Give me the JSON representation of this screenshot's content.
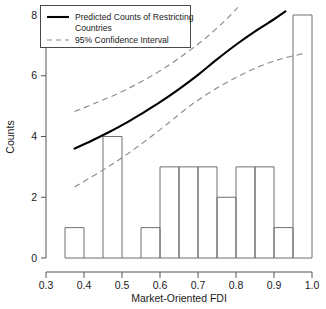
{
  "chart_data": {
    "type": "bar",
    "title": "",
    "xlabel": "Market-Oriented FDI",
    "ylabel": "Counts",
    "xlim": [
      0.3,
      1.0
    ],
    "ylim": [
      0,
      8
    ],
    "grid": false,
    "legend_position": "top-left",
    "x_ticks": [
      "0.3",
      "0.4",
      "0.5",
      "0.6",
      "0.7",
      "0.8",
      "0.9",
      "1.0"
    ],
    "x_tick_values": [
      0.3,
      0.4,
      0.5,
      0.6,
      0.7,
      0.8,
      0.9,
      1.0
    ],
    "y_ticks": [
      "0",
      "2",
      "4",
      "6",
      "8"
    ],
    "y_tick_values": [
      0,
      2,
      4,
      6,
      8
    ],
    "bin_width": 0.05,
    "bin_edges": [
      0.35,
      0.4,
      0.45,
      0.5,
      0.55,
      0.6,
      0.65,
      0.7,
      0.75,
      0.8,
      0.85,
      0.9,
      0.95,
      1.0
    ],
    "categories": [
      "0.35-0.40",
      "0.40-0.45",
      "0.45-0.50",
      "0.50-0.55",
      "0.55-0.60",
      "0.60-0.65",
      "0.65-0.70",
      "0.70-0.75",
      "0.75-0.80",
      "0.80-0.85",
      "0.85-0.90",
      "0.90-0.95",
      "0.95-1.00"
    ],
    "values": [
      1,
      0,
      4,
      0,
      1,
      3,
      3,
      3,
      2,
      3,
      3,
      1,
      8
    ],
    "series": [
      {
        "name": "Predicted Counts of Restricting Countries",
        "style": "solid",
        "color": "#000000",
        "points": [
          [
            0.375,
            3.6
          ],
          [
            0.42,
            3.86
          ],
          [
            0.465,
            4.14
          ],
          [
            0.51,
            4.44
          ],
          [
            0.55,
            4.74
          ],
          [
            0.6,
            5.13
          ],
          [
            0.65,
            5.56
          ],
          [
            0.7,
            6.03
          ],
          [
            0.75,
            6.54
          ],
          [
            0.8,
            7.02
          ],
          [
            0.855,
            7.5
          ],
          [
            0.9,
            7.86
          ],
          [
            0.93,
            8.12
          ]
        ]
      },
      {
        "name": "95% Confidence Interval Upper",
        "style": "dashed",
        "color": "#8c8c8c",
        "points": [
          [
            0.375,
            4.82
          ],
          [
            0.43,
            5.1
          ],
          [
            0.49,
            5.42
          ],
          [
            0.55,
            5.8
          ],
          [
            0.61,
            6.24
          ],
          [
            0.67,
            6.76
          ],
          [
            0.72,
            7.24
          ],
          [
            0.77,
            7.8
          ],
          [
            0.805,
            8.25
          ]
        ]
      },
      {
        "name": "95% Confidence Interval Lower",
        "style": "dashed",
        "color": "#8c8c8c",
        "points": [
          [
            0.375,
            2.34
          ],
          [
            0.44,
            2.82
          ],
          [
            0.5,
            3.3
          ],
          [
            0.56,
            3.84
          ],
          [
            0.62,
            4.42
          ],
          [
            0.68,
            5.02
          ],
          [
            0.74,
            5.52
          ],
          [
            0.8,
            5.94
          ],
          [
            0.86,
            6.3
          ],
          [
            0.92,
            6.56
          ],
          [
            0.975,
            6.72
          ]
        ]
      }
    ],
    "legend": [
      {
        "label_line1": "Predicted Counts of Restricting",
        "label_line2": "Countries",
        "style": "solid"
      },
      {
        "label_line1": "95% Confidence Interval",
        "label_line2": "",
        "style": "dashed"
      }
    ]
  }
}
